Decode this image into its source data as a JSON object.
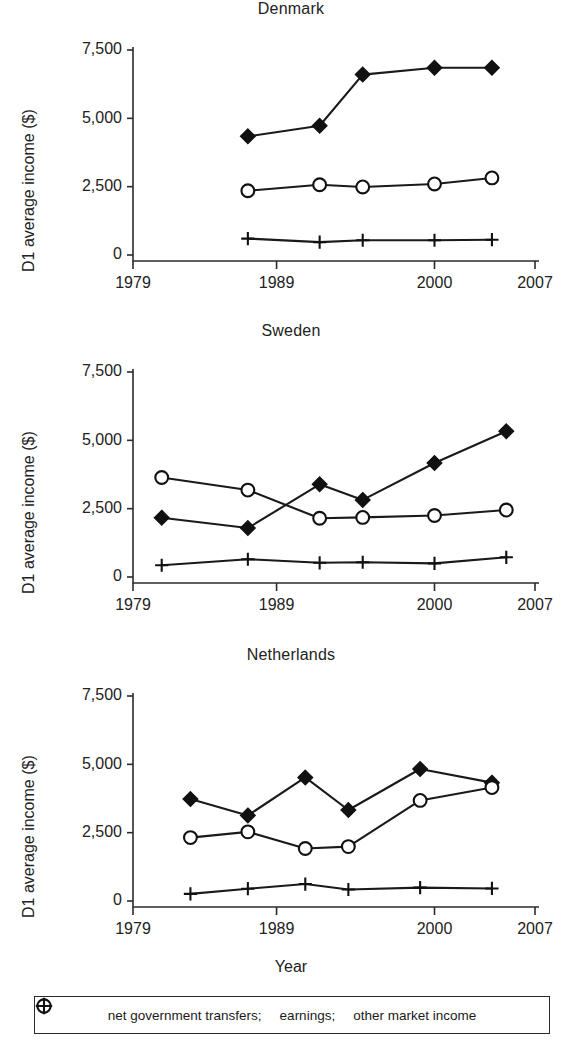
{
  "figure": {
    "xlabel": "Year",
    "ylabel": "D1 average income ($)"
  },
  "legend": {
    "items": [
      {
        "marker": "filled-diamond-marker",
        "label": "net government transfers;"
      },
      {
        "marker": "open-circle-marker",
        "label": "earnings;"
      },
      {
        "marker": "plus-marker",
        "label": "other market income"
      }
    ]
  },
  "chart_data": [
    {
      "type": "line",
      "title": "Denmark",
      "xlabel": "Year",
      "ylabel": "D1 average income ($)",
      "xlim": [
        1979,
        2007
      ],
      "ylim": [
        0,
        7500
      ],
      "xticks": [
        1979,
        1989,
        2000,
        2007
      ],
      "xticklabels": [
        "1979",
        "1989",
        "2000",
        "2007"
      ],
      "yticks": [
        0,
        2500,
        5000,
        7500
      ],
      "yticklabels": [
        "0",
        "2,500",
        "5,000",
        "7,500"
      ],
      "grid": false,
      "x": [
        1987,
        1992,
        1995,
        2000,
        2004
      ],
      "series": [
        {
          "name": "net government transfers;",
          "marker": "filled-diamond-marker",
          "values": [
            4340,
            4730,
            6600,
            6850,
            6850
          ]
        },
        {
          "name": "earnings;",
          "marker": "open-circle-marker",
          "values": [
            2350,
            2570,
            2490,
            2600,
            2820
          ]
        },
        {
          "name": "other market income",
          "marker": "plus-marker",
          "values": [
            600,
            470,
            540,
            540,
            560
          ]
        }
      ]
    },
    {
      "type": "line",
      "title": "Sweden",
      "xlabel": "Year",
      "ylabel": "D1 average income ($)",
      "xlim": [
        1979,
        2007
      ],
      "ylim": [
        0,
        7500
      ],
      "xticks": [
        1979,
        1989,
        2000,
        2007
      ],
      "xticklabels": [
        "1979",
        "1989",
        "2000",
        "2007"
      ],
      "yticks": [
        0,
        2500,
        5000,
        7500
      ],
      "yticklabels": [
        "0",
        "2,500",
        "5,000",
        "7,500"
      ],
      "grid": false,
      "x": [
        1981,
        1987,
        1992,
        1995,
        2000,
        2005
      ],
      "series": [
        {
          "name": "net government transfers;",
          "marker": "filled-diamond-marker",
          "values": [
            2170,
            1790,
            3390,
            2820,
            4170,
            5330
          ]
        },
        {
          "name": "earnings;",
          "marker": "open-circle-marker",
          "values": [
            3640,
            3180,
            2150,
            2180,
            2250,
            2450
          ]
        },
        {
          "name": "other market income",
          "marker": "plus-marker",
          "values": [
            430,
            650,
            520,
            540,
            500,
            720
          ]
        }
      ]
    },
    {
      "type": "line",
      "title": "Netherlands",
      "xlabel": "Year",
      "ylabel": "D1 average income ($)",
      "xlim": [
        1979,
        2007
      ],
      "ylim": [
        0,
        7500
      ],
      "xticks": [
        1979,
        1989,
        2000,
        2007
      ],
      "xticklabels": [
        "1979",
        "1989",
        "2000",
        "2007"
      ],
      "yticks": [
        0,
        2500,
        5000,
        7500
      ],
      "yticklabels": [
        "0",
        "2,500",
        "5,000",
        "7,500"
      ],
      "grid": false,
      "x": [
        1983,
        1987,
        1991,
        1994,
        1999,
        2004
      ],
      "series": [
        {
          "name": "net government transfers;",
          "marker": "filled-diamond-marker",
          "values": [
            3730,
            3130,
            4520,
            3330,
            4830,
            4330
          ]
        },
        {
          "name": "earnings;",
          "marker": "open-circle-marker",
          "values": [
            2320,
            2530,
            1920,
            1990,
            3680,
            4150
          ]
        },
        {
          "name": "other market income",
          "marker": "plus-marker",
          "values": [
            260,
            450,
            620,
            420,
            490,
            460
          ]
        }
      ]
    }
  ]
}
